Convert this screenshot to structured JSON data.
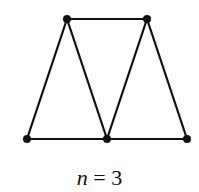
{
  "diagram": {
    "vertices": [
      {
        "id": "a",
        "x": 67,
        "y": 19
      },
      {
        "id": "b",
        "x": 147,
        "y": 19
      },
      {
        "id": "c",
        "x": 27,
        "y": 139
      },
      {
        "id": "d",
        "x": 107,
        "y": 139
      },
      {
        "id": "e",
        "x": 187,
        "y": 139
      }
    ],
    "edges": [
      [
        "a",
        "b"
      ],
      [
        "a",
        "c"
      ],
      [
        "a",
        "d"
      ],
      [
        "b",
        "d"
      ],
      [
        "b",
        "e"
      ],
      [
        "c",
        "d"
      ],
      [
        "d",
        "e"
      ]
    ],
    "label": {
      "variable": "n",
      "equals": " = ",
      "value": "3"
    },
    "stroke_color": "#111111"
  }
}
